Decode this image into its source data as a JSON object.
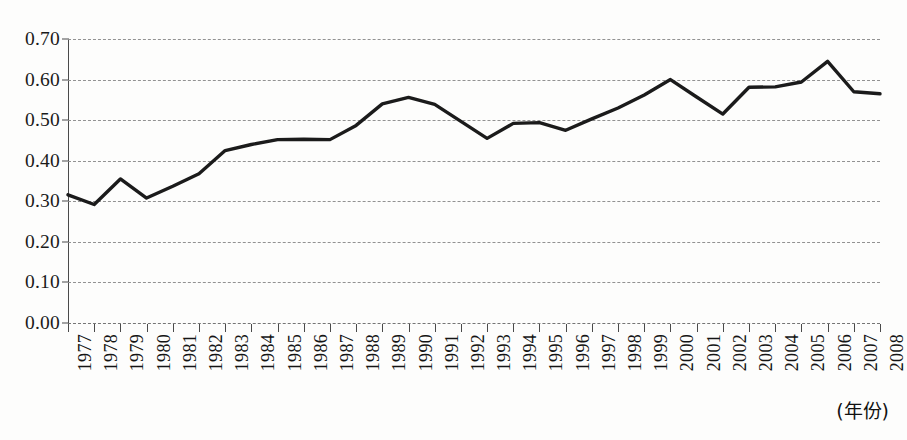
{
  "chart_data": {
    "type": "line",
    "title": "",
    "subtitle": "",
    "xlabel": "(年份)",
    "ylabel": "",
    "grid": true,
    "legend": "none",
    "xlim": [
      1977,
      2008
    ],
    "ylim": [
      0.0,
      0.7
    ],
    "ytick_labels": [
      "0.70",
      "0.60",
      "0.50",
      "0.40",
      "0.30",
      "0.20",
      "0.10",
      "0.00"
    ],
    "ytick_values": [
      0.7,
      0.6,
      0.5,
      0.4,
      0.3,
      0.2,
      0.1,
      0.0
    ],
    "categories": [
      "1977",
      "1978",
      "1979",
      "1980",
      "1981",
      "1982",
      "1983",
      "1984",
      "1985",
      "1986",
      "1987",
      "1988",
      "1989",
      "1990",
      "1991",
      "1992",
      "1993",
      "1994",
      "1995",
      "1996",
      "1997",
      "1998",
      "1999",
      "2000",
      "2001",
      "2002",
      "2003",
      "2004",
      "2005",
      "2006",
      "2007",
      "2008"
    ],
    "x": [
      1977,
      1978,
      1979,
      1980,
      1981,
      1982,
      1983,
      1984,
      1985,
      1986,
      1987,
      1988,
      1989,
      1990,
      1991,
      1992,
      1993,
      1994,
      1995,
      1996,
      1997,
      1998,
      1999,
      2000,
      2001,
      2002,
      2003,
      2004,
      2005,
      2006,
      2007,
      2008
    ],
    "values": [
      0.316,
      0.292,
      0.355,
      0.308,
      0.337,
      0.368,
      0.425,
      0.44,
      0.452,
      0.453,
      0.452,
      0.487,
      0.54,
      0.556,
      0.539,
      0.497,
      0.455,
      0.492,
      0.494,
      0.475,
      0.503,
      0.53,
      0.562,
      0.6,
      0.557,
      0.515,
      0.581,
      0.582,
      0.594,
      0.645,
      0.57,
      0.565
    ],
    "series": [
      {
        "name": "series-1",
        "color": "#1b1b1b",
        "line_width": 3.4,
        "values": [
          0.316,
          0.292,
          0.355,
          0.308,
          0.337,
          0.368,
          0.425,
          0.44,
          0.452,
          0.453,
          0.452,
          0.487,
          0.54,
          0.556,
          0.539,
          0.497,
          0.455,
          0.492,
          0.494,
          0.475,
          0.503,
          0.53,
          0.562,
          0.6,
          0.557,
          0.515,
          0.581,
          0.582,
          0.594,
          0.645,
          0.57,
          0.565
        ]
      }
    ],
    "colors": {
      "line": "#1b1b1b",
      "grid": "#8d8d8d",
      "axis": "#4a4a4a",
      "text": "#141414",
      "background": "#fdfdfc"
    }
  }
}
